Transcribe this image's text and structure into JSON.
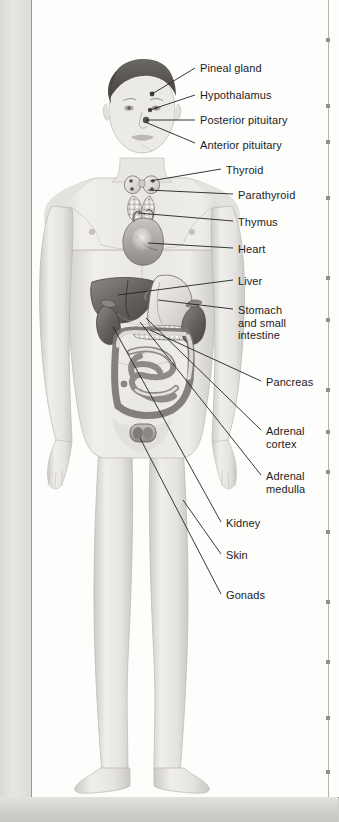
{
  "figure": {
    "style": "grayscale medical illustration",
    "colors": {
      "page": "#fdfdfc",
      "skin": "#eceae7",
      "skin_shadow": "#c9c7c3",
      "organ_dark": "#6f6c69",
      "organ_mid": "#9c9894",
      "organ_light": "#dedbd7",
      "leader_line": "#2b2b2b",
      "label_text": "#1c1c1c",
      "rule": "#b4b4b0"
    }
  },
  "labels": [
    {
      "id": "pineal-gland",
      "text": "Pineal gland",
      "x": 200,
      "y": 62,
      "line": [
        195,
        68,
        152,
        94
      ]
    },
    {
      "id": "hypothalamus",
      "text": "Hypothalamus",
      "x": 200,
      "y": 89,
      "line": [
        195,
        95,
        150,
        110
      ]
    },
    {
      "id": "posterior-pituitary",
      "text": "Posterior pituitary",
      "x": 200,
      "y": 114,
      "line": [
        195,
        120,
        146,
        120
      ]
    },
    {
      "id": "anterior-pituitary",
      "text": "Anterior pituitary",
      "x": 200,
      "y": 139,
      "line": [
        195,
        143,
        145,
        122
      ]
    },
    {
      "id": "thyroid",
      "text": "Thyroid",
      "x": 226,
      "y": 164,
      "line": [
        221,
        169,
        150,
        181
      ]
    },
    {
      "id": "parathyroid",
      "text": "Parathyroid",
      "x": 238,
      "y": 189,
      "line": [
        233,
        194,
        148,
        190
      ]
    },
    {
      "id": "thymus",
      "text": "Thymus",
      "x": 238,
      "y": 216,
      "line": [
        233,
        221,
        138,
        213
      ]
    },
    {
      "id": "heart",
      "text": "Heart",
      "x": 238,
      "y": 243,
      "line": [
        233,
        248,
        148,
        243
      ]
    },
    {
      "id": "liver",
      "text": "Liver",
      "x": 238,
      "y": 275,
      "line": [
        233,
        280,
        118,
        295
      ]
    },
    {
      "id": "stomach-and-small-intestine",
      "text": "Stomach\nand small\nintestine",
      "x": 238,
      "y": 304,
      "line": [
        233,
        309,
        158,
        300
      ]
    },
    {
      "id": "pancreas",
      "text": "Pancreas",
      "x": 266,
      "y": 376,
      "line": [
        261,
        381,
        150,
        330
      ]
    },
    {
      "id": "adrenal-cortex",
      "text": "Adrenal\ncortex",
      "x": 266,
      "y": 425,
      "line": [
        261,
        430,
        146,
        318
      ]
    },
    {
      "id": "adrenal-medulla",
      "text": "Adrenal\nmedulla",
      "x": 266,
      "y": 470,
      "line": [
        261,
        475,
        140,
        322
      ]
    },
    {
      "id": "kidney",
      "text": "Kidney",
      "x": 226,
      "y": 517,
      "line": [
        221,
        522,
        113,
        327
      ]
    },
    {
      "id": "skin",
      "text": "Skin",
      "x": 226,
      "y": 549,
      "line": [
        221,
        554,
        183,
        500
      ]
    },
    {
      "id": "gonads",
      "text": "Gonads",
      "x": 226,
      "y": 589,
      "line": [
        221,
        594,
        140,
        438
      ]
    }
  ],
  "organs": [
    {
      "id": "pineal-gland",
      "name": "Pineal gland"
    },
    {
      "id": "hypothalamus",
      "name": "Hypothalamus"
    },
    {
      "id": "pituitary",
      "name": "Pituitary gland"
    },
    {
      "id": "thyroid",
      "name": "Thyroid gland"
    },
    {
      "id": "parathyroid",
      "name": "Parathyroid glands"
    },
    {
      "id": "thymus",
      "name": "Thymus"
    },
    {
      "id": "heart",
      "name": "Heart"
    },
    {
      "id": "liver",
      "name": "Liver"
    },
    {
      "id": "stomach",
      "name": "Stomach"
    },
    {
      "id": "pancreas",
      "name": "Pancreas"
    },
    {
      "id": "adrenal-glands",
      "name": "Adrenal glands"
    },
    {
      "id": "kidneys",
      "name": "Kidneys"
    },
    {
      "id": "intestines",
      "name": "Small and large intestine"
    },
    {
      "id": "gonads",
      "name": "Gonads (testes)"
    }
  ],
  "page_rule": {
    "tick_positions": [
      38,
      104,
      140,
      196,
      276,
      318,
      388,
      430,
      470,
      530,
      600,
      660,
      716,
      770
    ]
  }
}
